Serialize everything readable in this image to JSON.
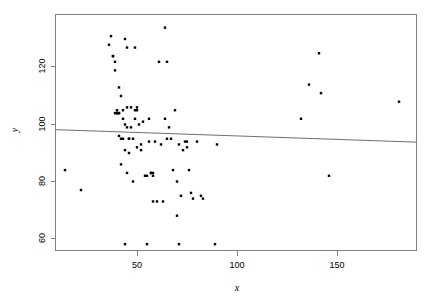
{
  "chart_data": {
    "type": "scatter",
    "title": "",
    "subtitle": "",
    "xlabel": "x",
    "ylabel": "y",
    "xlim": [
      9,
      190
    ],
    "ylim": [
      55,
      138
    ],
    "xticks": [
      50,
      100,
      150
    ],
    "xtick_labels": [
      "50",
      "100",
      "150"
    ],
    "yticks": [
      60,
      80,
      100,
      120
    ],
    "ytick_labels": [
      "60",
      "80",
      "100",
      "120"
    ],
    "grid": false,
    "legend": null,
    "point_color": "#000000",
    "point_marker": "square",
    "point_size_px": 2.4,
    "frame_color": "#808080",
    "fit_line": {
      "type": "linear-regression",
      "color": "#707070",
      "x_start": 9,
      "y_start": 98.2,
      "x_end": 190,
      "y_end": 93.8
    },
    "x": [
      14,
      22,
      36,
      37,
      38,
      38,
      39,
      39,
      39,
      40,
      40,
      40,
      40,
      41,
      41,
      41,
      41,
      42,
      42,
      42,
      43,
      43,
      43,
      44,
      44,
      44,
      44,
      45,
      45,
      45,
      45,
      46,
      46,
      46,
      47,
      47,
      48,
      48,
      49,
      49,
      49,
      50,
      50,
      50,
      51,
      52,
      52,
      53,
      54,
      55,
      55,
      56,
      56,
      57,
      57,
      58,
      58,
      58,
      59,
      60,
      61,
      62,
      63,
      64,
      64,
      65,
      65,
      66,
      67,
      68,
      69,
      70,
      70,
      71,
      71,
      72,
      73,
      74,
      75,
      75,
      76,
      77,
      78,
      80,
      82,
      83,
      89,
      90,
      132,
      136,
      141,
      142,
      146,
      181
    ],
    "y": [
      84,
      77,
      128,
      131,
      124,
      124,
      122,
      119,
      104,
      104,
      104,
      104,
      105,
      113,
      104,
      104,
      96,
      110,
      95,
      86,
      105,
      102,
      95,
      130,
      100,
      91,
      58,
      127,
      106,
      99,
      83,
      95,
      95,
      90,
      106,
      99,
      80,
      95,
      127,
      105,
      102,
      106,
      105,
      92,
      100,
      93,
      91,
      101,
      82,
      82,
      58,
      102,
      94,
      83,
      83,
      83,
      82,
      73,
      94,
      73,
      122,
      93,
      73,
      134,
      102,
      122,
      95,
      99,
      95,
      84,
      105,
      80,
      68,
      93,
      58,
      75,
      91,
      94,
      94,
      92,
      84,
      76,
      74,
      94,
      75,
      74,
      58,
      93,
      102,
      114,
      125,
      111,
      82,
      108
    ],
    "n_points": 94
  },
  "axis_titles": {
    "x": "x",
    "y": "y"
  }
}
